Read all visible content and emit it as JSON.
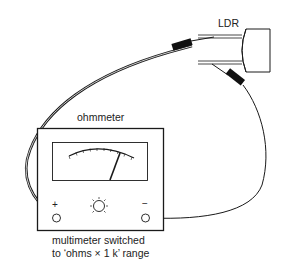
{
  "diagram": {
    "type": "circuit-illustration",
    "component_label": "LDR",
    "instrument_label": "ohmmeter",
    "terminals": {
      "positive": "+",
      "negative": "−"
    },
    "caption": {
      "line1": "multimeter switched",
      "line2": "to ‘ohms × 1 k’ range"
    },
    "parts": [
      {
        "name": "LDR",
        "kind": "light-dependent resistor",
        "leads": 2
      },
      {
        "name": "ohmmeter",
        "kind": "analog meter",
        "scale_ticks": 10,
        "needle": "deflected right"
      },
      {
        "name": "test leads",
        "kind": "wires with crocodile clips",
        "count": 2
      },
      {
        "name": "zero-adjust knob",
        "kind": "control"
      }
    ],
    "colors": {
      "line": "#1a1a1a",
      "background": "#ffffff"
    }
  }
}
